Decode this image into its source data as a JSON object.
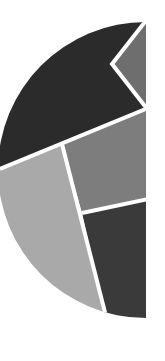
{
  "graphic": {
    "description": "Half-circle emblem split into shaded polygonal segments",
    "colors": {
      "background": "#ffffff",
      "divider": "#ffffff",
      "top_segment": "#2b2b2b",
      "notch_segment": "#6e6e6e",
      "middle_right_segment": "#7d7d7d",
      "left_lower_segment": "#a9a9a9",
      "bottom_right_segment": "#3a3a3a"
    }
  }
}
